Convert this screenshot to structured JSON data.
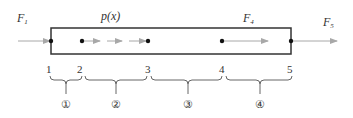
{
  "diagram": {
    "forces": {
      "F1": {
        "label": "F",
        "sub": "1"
      },
      "F4": {
        "label": "F",
        "sub": "4"
      },
      "F5": {
        "label": "F",
        "sub": "5"
      },
      "distributed": {
        "label": "p(x)"
      }
    },
    "nodes": [
      "1",
      "2",
      "3",
      "4",
      "5"
    ],
    "elements": [
      "①",
      "②",
      "③",
      "④"
    ],
    "colors": {
      "bar_outline": "#333333",
      "arrow": "#a0a0a0",
      "node": "#111111"
    }
  }
}
